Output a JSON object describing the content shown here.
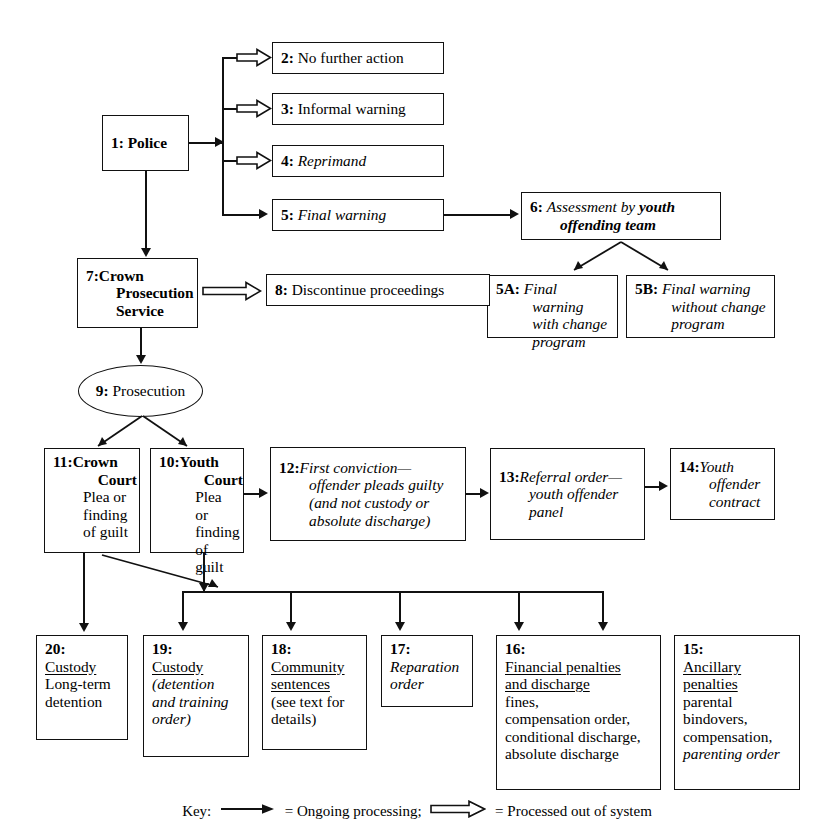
{
  "diagram": {
    "nodes": [
      {
        "id": "1",
        "label": "1:",
        "text": "Police",
        "style": "bold"
      },
      {
        "id": "2",
        "label": "2:",
        "text": "No further action",
        "style": "roman"
      },
      {
        "id": "3",
        "label": "3:",
        "text": "Informal warning",
        "style": "roman"
      },
      {
        "id": "4",
        "label": "4:",
        "text": "Reprimand",
        "style": "italic"
      },
      {
        "id": "5",
        "label": "5:",
        "text": "Final warning",
        "style": "italic"
      },
      {
        "id": "6",
        "label": "6:",
        "text": "Assessment by youth offending team",
        "style": "italic-bold-tail"
      },
      {
        "id": "5A",
        "label": "5A:",
        "text": "Final warning with change program",
        "style": "italic"
      },
      {
        "id": "5B",
        "label": "5B:",
        "text": "Final warning without change program",
        "style": "italic"
      },
      {
        "id": "7",
        "label": "7:",
        "text": "Crown Prosecution Service",
        "style": "bold"
      },
      {
        "id": "8",
        "label": "8:",
        "text": "Discontinue proceedings",
        "style": "roman"
      },
      {
        "id": "9",
        "label": "9:",
        "text": "Prosecution",
        "style": "roman",
        "shape": "ellipse"
      },
      {
        "id": "10",
        "label": "10:",
        "text": "Youth Court",
        "text2": "Plea or finding of guilt",
        "style": "bold-head"
      },
      {
        "id": "11",
        "label": "11:",
        "text": "Crown Court",
        "text2": "Plea or finding of guilt",
        "style": "bold-head"
      },
      {
        "id": "12",
        "label": "12:",
        "text": "First conviction—offender pleads guilty (and not custody or absolute discharge)",
        "style": "italic"
      },
      {
        "id": "13",
        "label": "13:",
        "text": "Referral order—youth offender panel",
        "style": "italic"
      },
      {
        "id": "14",
        "label": "14:",
        "text": "Youth offender contract",
        "style": "italic"
      },
      {
        "id": "15",
        "label": "15:",
        "head": "Ancillary penalties",
        "body": "parental bindovers, compensation,",
        "tail": "parenting order"
      },
      {
        "id": "16",
        "label": "16:",
        "head": "Financial penalties and discharge",
        "body": "fines, compensation order, conditional discharge, absolute discharge"
      },
      {
        "id": "17",
        "label": "17:",
        "text": "Reparation order",
        "style": "italic"
      },
      {
        "id": "18",
        "label": "18:",
        "head": "Community sentences",
        "body": "(see text for details)"
      },
      {
        "id": "19",
        "label": "19:",
        "head": "Custody",
        "tail": "(detention and training order)"
      },
      {
        "id": "20",
        "label": "20:",
        "head": "Custody",
        "body": "Long-term detention"
      }
    ]
  },
  "node_text": {
    "n1_num": "1:",
    "n1_body": "Police",
    "n2_num": "2:",
    "n2_body": "No further action",
    "n3_num": "3:",
    "n3_body": "Informal warning",
    "n4_num": "4:",
    "n4_body": "Reprimand",
    "n5_num": "5:",
    "n5_body": "Final warning",
    "n6_num": "6:",
    "n6_body_a": "Assessment by ",
    "n6_body_b": "youth offending team",
    "n5a_num": "5A:",
    "n5a_body": "Final warning with change program",
    "n5b_num": "5B:",
    "n5b_body": "Final warning without change program",
    "n7_num": "7:",
    "n7_l1": "Crown",
    "n7_l2": "Prosecution",
    "n7_l3": "Service",
    "n8_num": "8:",
    "n8_body": "Discontinue proceedings",
    "n9_num": "9:",
    "n9_body": "Prosecution",
    "n10_num": "10:",
    "n10_l1": "Youth",
    "n10_l2": "Court",
    "n10_l3": "Plea or",
    "n10_l4": "finding",
    "n10_l5": "of guilt",
    "n11_num": "11:",
    "n11_l1": "Crown",
    "n11_l2": "Court",
    "n11_l3": "Plea or",
    "n11_l4": "finding",
    "n11_l5": "of guilt",
    "n12_num": "12:",
    "n12_l1": "First conviction—",
    "n12_l2": "offender pleads guilty",
    "n12_l3": "(and not custody or",
    "n12_l4": "absolute discharge)",
    "n13_num": "13:",
    "n13_l1": "Referral order—",
    "n13_l2": "youth offender",
    "n13_l3": "panel",
    "n14_num": "14:",
    "n14_l1": "Youth",
    "n14_l2": "offender",
    "n14_l3": "contract",
    "n15_num": "15:",
    "n15_h1": "Ancillary",
    "n15_h2": "penalties",
    "n15_b1": "parental",
    "n15_b2": "bindovers,",
    "n15_b3": "compensation,",
    "n15_b4": "parenting order",
    "n16_num": "16:",
    "n16_h1": "Financial penalties",
    "n16_h2": "and discharge",
    "n16_b1": "fines,",
    "n16_b2": "compensation order,",
    "n16_b3": "conditional discharge,",
    "n16_b4": "absolute discharge",
    "n17_num": "17:",
    "n17_l1": "Reparation",
    "n17_l2": "order",
    "n18_num": "18:",
    "n18_h1": "Community",
    "n18_h2": "sentences",
    "n18_b1": "(see text for",
    "n18_b2": "details)",
    "n19_num": "19:",
    "n19_h1": "Custody",
    "n19_b1": "(detention",
    "n19_b2": "and training",
    "n19_b3": "order)",
    "n20_num": "20:",
    "n20_h1": "Custody",
    "n20_b1": "Long-term",
    "n20_b2": "detention"
  },
  "key": {
    "label": "Key:",
    "solid_meaning": "= Ongoing processing;",
    "hollow_meaning": "= Processed out of system"
  },
  "colors": {
    "stroke": "#111111",
    "background": "#ffffff",
    "text": "#000000"
  }
}
